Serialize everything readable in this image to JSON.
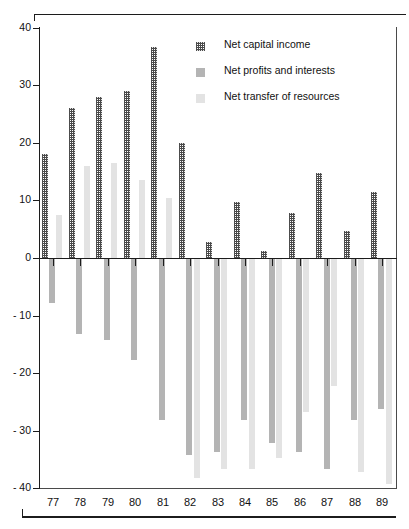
{
  "top_caption": "",
  "legend": {
    "items": [
      {
        "label": "Net capital income",
        "key": "capital",
        "swatch": "dark-hatched-swatch"
      },
      {
        "label": "Net profits and interests",
        "key": "profits",
        "swatch": "medium-grey-swatch"
      },
      {
        "label": "Net transfer of resources",
        "key": "transfer",
        "swatch": "light-grey-swatch"
      }
    ]
  },
  "chart_data": {
    "type": "bar",
    "title": "",
    "subtitle": "",
    "xlabel": "",
    "ylabel": "",
    "grid": false,
    "legend_position": "top-right",
    "orientation": "vertical",
    "grouped": true,
    "ylim": [
      -40,
      40
    ],
    "yticks": [
      40,
      30,
      20,
      10,
      0,
      -10,
      -20,
      -30,
      -40
    ],
    "ytick_labels": [
      "40",
      "30",
      "20",
      "10",
      "0",
      "- 10",
      "- 20",
      "- 30",
      "- 40"
    ],
    "categories": [
      "77",
      "78",
      "79",
      "80",
      "81",
      "82",
      "83",
      "84",
      "85",
      "86",
      "87",
      "88",
      "89"
    ],
    "series": [
      {
        "name": "Net capital income",
        "key": "capital",
        "color": "#4a4a4a",
        "pattern": "dense-checker-hatch",
        "values": [
          18.0,
          26.0,
          28.0,
          29.0,
          36.7,
          20.0,
          2.8,
          9.7,
          1.3,
          7.8,
          14.7,
          4.7,
          11.5
        ]
      },
      {
        "name": "Net profits and interests",
        "key": "profits",
        "color": "#b4b4b4",
        "pattern": "solid",
        "values": [
          -7.6,
          -13.0,
          -14.0,
          -17.5,
          -28.0,
          -34.0,
          -33.5,
          -28.0,
          -32.0,
          -33.5,
          -36.5,
          -28.0,
          -26.0
        ]
      },
      {
        "name": "Net transfer of resources",
        "key": "transfer",
        "color": "#e3e3e3",
        "pattern": "solid",
        "values": [
          7.5,
          16.0,
          16.5,
          13.5,
          10.5,
          -38.0,
          -36.5,
          -36.5,
          -34.5,
          -26.5,
          -22.0,
          -37.0,
          -39.0
        ]
      }
    ]
  }
}
